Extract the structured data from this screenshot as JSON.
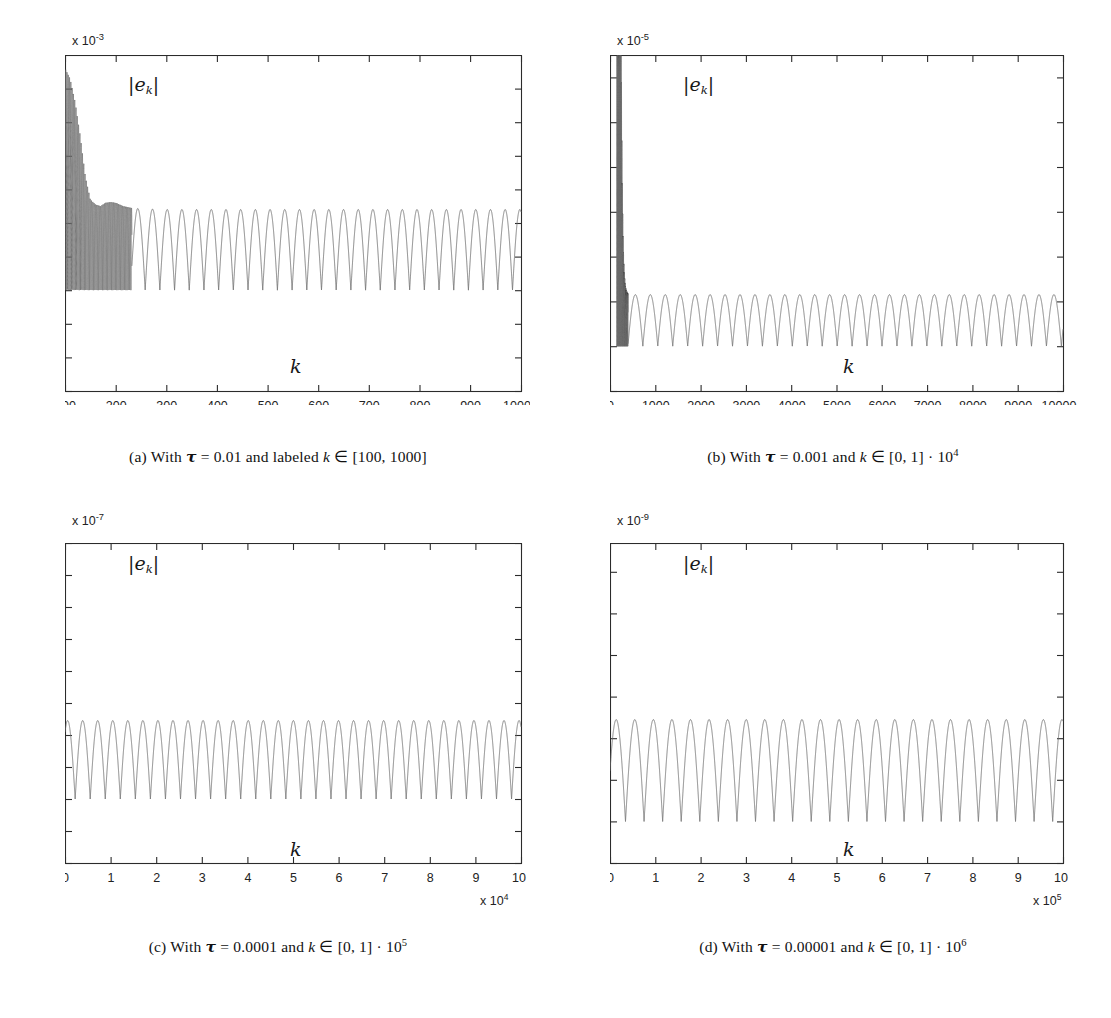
{
  "figure": {
    "panel_count": 4,
    "series_label": "|e_k|",
    "xlabel": "k"
  },
  "panels": [
    {
      "id": "a",
      "caption_prefix": "(a) With ",
      "caption_tau": "τ",
      "caption_mid": " = 0.01 and labeled ",
      "caption_var": "k",
      "caption_range": " ∈ [100, 1000]",
      "caption_plain": "(a) With τ = 0.01 and labeled k ∈ [100, 1000]",
      "tau": 0.01,
      "y_exp_prefix": "x 10",
      "y_exp_power": "-3",
      "x_exp_prefix": "",
      "x_exp_power": "",
      "series_label": "|e_k|",
      "xlabel": "k",
      "yticks": [
        "-3",
        "-2",
        "-1",
        "0",
        "1",
        "2",
        "3",
        "4",
        "5",
        "6"
      ],
      "xticks": [
        "100",
        "200",
        "300",
        "400",
        "500",
        "600",
        "700",
        "800",
        "900",
        "1000"
      ],
      "ylim": [
        -3,
        7
      ],
      "xlim": [
        100,
        1000
      ]
    },
    {
      "id": "b",
      "caption_prefix": "(b) With ",
      "caption_tau": "τ",
      "caption_mid": " = 0.001 and ",
      "caption_var": "k",
      "caption_range": " ∈ [0, 1] · 10",
      "caption_exp": "4",
      "caption_plain": "(b) With τ = 0.001 and k ∈ [0, 1] · 10⁴",
      "tau": 0.001,
      "y_exp_prefix": "x 10",
      "y_exp_power": "-5",
      "x_exp_prefix": "",
      "x_exp_power": "",
      "series_label": "|e_k|",
      "xlabel": "k",
      "yticks": [
        "-2",
        "0",
        "2",
        "4",
        "6",
        "8",
        "10",
        "12"
      ],
      "xticks": [
        "0",
        "1000",
        "2000",
        "3000",
        "4000",
        "5000",
        "6000",
        "7000",
        "8000",
        "9000",
        "10000"
      ],
      "ylim": [
        -2,
        13
      ],
      "xlim": [
        0,
        10000
      ]
    },
    {
      "id": "c",
      "caption_prefix": "(c) With ",
      "caption_tau": "τ",
      "caption_mid": " = 0.0001 and ",
      "caption_var": "k",
      "caption_range": " ∈ [0, 1] · 10",
      "caption_exp": "5",
      "caption_plain": "(c) With τ = 0.0001 and k ∈ [0, 1] · 10⁵",
      "tau": 0.0001,
      "y_exp_prefix": "x 10",
      "y_exp_power": "-7",
      "x_exp_prefix": "x 10",
      "x_exp_power": "4",
      "series_label": "|e_k|",
      "xlabel": "k",
      "yticks": [
        "-2",
        "-1",
        "0",
        "1",
        "2",
        "3",
        "4",
        "5",
        "6",
        "7",
        "8"
      ],
      "xticks": [
        "0",
        "1",
        "2",
        "3",
        "4",
        "5",
        "6",
        "7",
        "8",
        "9",
        "10"
      ],
      "ylim": [
        -2,
        8
      ],
      "xlim": [
        0,
        10
      ]
    },
    {
      "id": "d",
      "caption_prefix": "(d) With ",
      "caption_tau": "τ",
      "caption_mid": " = 0.00001 and ",
      "caption_var": "k",
      "caption_range": " ∈ [0, 1] · 10",
      "caption_exp": "6",
      "caption_plain": "(d) With τ = 0.00001 and k ∈ [0, 1] · 10⁶",
      "tau": 1e-05,
      "y_exp_prefix": "x 10",
      "y_exp_power": "-9",
      "x_exp_prefix": "x 10",
      "x_exp_power": "5",
      "series_label": "|e_k|",
      "xlabel": "k",
      "yticks": [
        "-1",
        "0",
        "1",
        "2",
        "3",
        "4",
        "5",
        "6"
      ],
      "xticks": [
        "0",
        "1",
        "2",
        "3",
        "4",
        "5",
        "6",
        "7",
        "8",
        "9",
        "10"
      ],
      "ylim": [
        -1,
        6.7
      ],
      "xlim": [
        0,
        10
      ]
    }
  ],
  "chart_data": [
    {
      "type": "line",
      "panel": "a",
      "title": "(a) With τ = 0.01 and labeled k ∈ [100, 1000]",
      "xlabel": "k",
      "ylabel": "|e_k|",
      "y_scale_exponent": -3,
      "x_scale_exponent": 0,
      "xlim": [
        100,
        1000
      ],
      "ylim": [
        -3,
        7
      ],
      "yticks": [
        -3,
        -2,
        -1,
        0,
        1,
        2,
        3,
        4,
        5,
        6
      ],
      "xticks": [
        100,
        200,
        300,
        400,
        500,
        600,
        700,
        800,
        900,
        1000
      ],
      "grid": false,
      "legend": "none",
      "description": "Rectified-sine |e_k| envelope decaying from ~6.6e-3 at k=100 to a steady ~2.4e-3 oscillation by k~240; dense unresolved oscillation for k<230.",
      "envelope_x": [
        100,
        110,
        120,
        130,
        140,
        150,
        160,
        170,
        180,
        190,
        200,
        215,
        230,
        250,
        300,
        500,
        700,
        1000
      ],
      "envelope_y": [
        6.6,
        6.3,
        5.6,
        4.6,
        3.4,
        2.7,
        2.55,
        2.5,
        2.6,
        2.62,
        2.6,
        2.5,
        2.45,
        2.42,
        2.4,
        2.4,
        2.4,
        2.4
      ],
      "steady_amplitude": 2.4,
      "oscillation_period_x": 29,
      "dense_region_x": [
        100,
        230
      ]
    },
    {
      "type": "line",
      "panel": "b",
      "title": "(b) With τ = 0.001 and k ∈ [0, 1] · 10⁴",
      "xlabel": "k",
      "ylabel": "|e_k|",
      "y_scale_exponent": -5,
      "x_scale_exponent": 0,
      "xlim": [
        0,
        10000
      ],
      "ylim": [
        -2,
        13
      ],
      "yticks": [
        -2,
        0,
        2,
        4,
        6,
        8,
        10,
        12
      ],
      "xticks": [
        0,
        1000,
        2000,
        3000,
        4000,
        5000,
        6000,
        7000,
        8000,
        9000,
        10000
      ],
      "grid": false,
      "legend": "none",
      "description": "Narrow tall transient spike near k~250 reaching above 13e-5 (clipped at top), settling to steady rectified-sine oscillation of amplitude ~2.3e-5.",
      "spike_x": 250,
      "spike_peak_y": 13,
      "steady_amplitude": 2.3,
      "oscillation_period_x": 330,
      "settle_x": 400
    },
    {
      "type": "line",
      "panel": "c",
      "title": "(c) With τ = 0.0001 and k ∈ [0, 1] · 10⁵",
      "xlabel": "k",
      "ylabel": "|e_k|",
      "y_scale_exponent": -7,
      "x_scale_exponent": 4,
      "xlim": [
        0,
        10
      ],
      "ylim": [
        -2,
        8
      ],
      "yticks": [
        -2,
        -1,
        0,
        1,
        2,
        3,
        4,
        5,
        6,
        7,
        8
      ],
      "xticks": [
        0,
        1,
        2,
        3,
        4,
        5,
        6,
        7,
        8,
        9,
        10
      ],
      "grid": false,
      "legend": "none",
      "description": "Steady rectified-sine oscillation of amplitude ~2.45e-7 across the whole range, starting at ~2.1e-7 at k=0.",
      "steady_amplitude": 2.45,
      "oscillation_period_x": 0.33,
      "start_y": 2.1
    },
    {
      "type": "line",
      "panel": "d",
      "title": "(d) With τ = 0.00001 and k ∈ [0, 1] · 10⁶",
      "xlabel": "k",
      "ylabel": "|e_k|",
      "y_scale_exponent": -9,
      "x_scale_exponent": 5,
      "xlim": [
        0,
        10
      ],
      "ylim": [
        -1,
        6.7
      ],
      "yticks": [
        -1,
        0,
        1,
        2,
        3,
        4,
        5,
        6
      ],
      "xticks": [
        0,
        1,
        2,
        3,
        4,
        5,
        6,
        7,
        8,
        9,
        10
      ],
      "grid": false,
      "legend": "none",
      "description": "Steady rectified-sine oscillation of amplitude ~2.45e-9 across the whole range, starting near ~1.2e-9 at k=0.",
      "steady_amplitude": 2.45,
      "oscillation_period_x": 0.41,
      "start_y": 1.2
    }
  ]
}
